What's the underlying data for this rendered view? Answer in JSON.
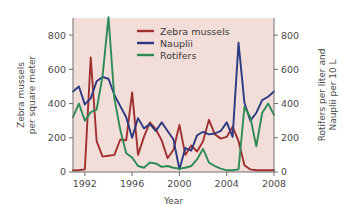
{
  "chart_data": {
    "type": "line",
    "title": "",
    "xlabel": "Year",
    "ylabel": "Zebra mussels per square meter",
    "y2label": "Rotifers per liter and Nauplii per 10 L",
    "xlim": [
      1991,
      2008
    ],
    "ylim": [
      0,
      900
    ],
    "y2lim": [
      0,
      900
    ],
    "xticks": [
      1992,
      1996,
      2000,
      2004,
      2008
    ],
    "xticklabels": [
      "1992",
      "1996",
      "2000",
      "2004",
      "2008"
    ],
    "yticks": [
      0,
      200,
      400,
      600,
      800
    ],
    "yticklabels": [
      "0",
      "200",
      "400",
      "600",
      "800"
    ],
    "y2ticks": [
      0,
      200,
      400,
      600,
      800
    ],
    "y2ticklabels": [
      "0",
      "200",
      "400",
      "600",
      "800"
    ],
    "grid": false,
    "legend_position": "top-center",
    "plot_background": "#f2ddd8",
    "series": [
      {
        "name": "Zebra mussels",
        "color": "#a03030",
        "axis": "left",
        "x": [
          1991,
          1991.5,
          1992,
          1992.5,
          1993,
          1993.5,
          1994,
          1994.5,
          1995,
          1995.5,
          1996,
          1996.5,
          1997,
          1997.5,
          1998,
          1998.5,
          1999,
          1999.5,
          2000,
          2000.5,
          2001,
          2001.5,
          2002,
          2002.5,
          2003,
          2003.5,
          2004,
          2004.5,
          2005,
          2005.5,
          2006,
          2006.5,
          2007,
          2007.5,
          2008
        ],
        "values": [
          10,
          10,
          15,
          670,
          180,
          90,
          95,
          100,
          190,
          185,
          465,
          100,
          205,
          290,
          250,
          185,
          80,
          130,
          275,
          100,
          155,
          120,
          180,
          305,
          220,
          195,
          205,
          265,
          180,
          40,
          15,
          10,
          10,
          10,
          10
        ]
      },
      {
        "name": "Nauplii",
        "color": "#2b3a80",
        "axis": "right",
        "x": [
          1991,
          1991.5,
          1992,
          1992.5,
          1993,
          1993.5,
          1994,
          1994.5,
          1995,
          1995.5,
          1996,
          1996.5,
          1997,
          1997.5,
          1998,
          1998.5,
          1999,
          1999.5,
          2000,
          2000.5,
          2001,
          2001.5,
          2002,
          2002.5,
          2003,
          2003.5,
          2004,
          2004.5,
          2005,
          2005.5,
          2006,
          2006.5,
          2007,
          2007.5,
          2008
        ],
        "values": [
          470,
          500,
          395,
          430,
          530,
          555,
          545,
          450,
          385,
          320,
          200,
          315,
          255,
          280,
          240,
          290,
          240,
          190,
          15,
          140,
          125,
          215,
          235,
          220,
          225,
          240,
          290,
          205,
          755,
          405,
          300,
          345,
          420,
          440,
          470
        ]
      },
      {
        "name": "Rotifers",
        "color": "#2e8b57",
        "axis": "right",
        "x": [
          1991,
          1991.5,
          1992,
          1992.5,
          1993,
          1993.5,
          1994,
          1994.5,
          1995,
          1995.5,
          1996,
          1996.5,
          1997,
          1997.5,
          1998,
          1998.5,
          1999,
          1999.5,
          2000,
          2000.5,
          2001,
          2001.5,
          2002,
          2002.5,
          2003,
          2003.5,
          2004,
          2004.5,
          2005,
          2005.5,
          2006,
          2006.5,
          2007,
          2007.5,
          2008
        ],
        "values": [
          320,
          400,
          300,
          350,
          365,
          560,
          905,
          430,
          245,
          110,
          85,
          35,
          25,
          55,
          50,
          30,
          35,
          25,
          20,
          25,
          35,
          75,
          135,
          55,
          35,
          20,
          10,
          10,
          15,
          380,
          320,
          150,
          345,
          400,
          335
        ]
      }
    ]
  },
  "axes": {
    "left_title_line1": "Zebra mussels",
    "left_title_line2": "per square meter",
    "right_title_line1": "Rotifers per liter and",
    "right_title_line2": "Nauplii per 10 L",
    "x_title": "Year"
  },
  "legend": {
    "items": [
      {
        "label": "Zebra mussels",
        "color": "#a03030"
      },
      {
        "label": "Nauplii",
        "color": "#2b3a80"
      },
      {
        "label": "Rotifers",
        "color": "#2e8b57"
      }
    ]
  }
}
